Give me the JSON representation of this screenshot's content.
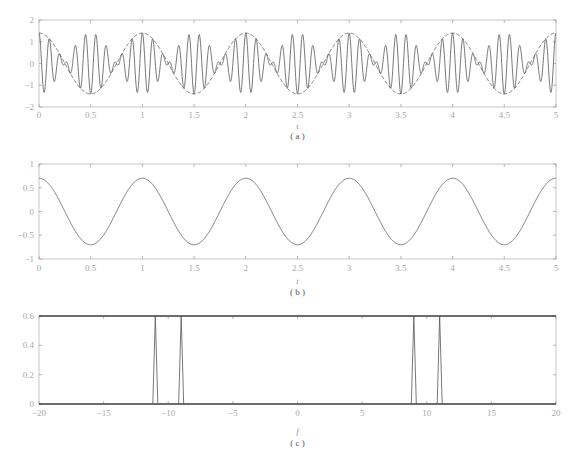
{
  "chart_data": [
    {
      "id": "a",
      "type": "line",
      "caption": "( a )",
      "xlabel": "t",
      "ylabel": "",
      "xlim": [
        0,
        5
      ],
      "ylim": [
        -2,
        2
      ],
      "xticks": [
        "0",
        "0.5",
        "1",
        "1.5",
        "2",
        "2.5",
        "3",
        "3.5",
        "4",
        "4.5",
        "5"
      ],
      "yticks": [
        "2",
        "1",
        "0",
        "-1",
        "-2"
      ],
      "grid": false,
      "series": [
        {
          "name": "signal",
          "style": "solid",
          "description": "0.7cos(2π·9t)+0.7cos(2π·11t)",
          "components": [
            {
              "amp": 0.7,
              "freq": 9
            },
            {
              "amp": 0.7,
              "freq": 11
            }
          ]
        },
        {
          "name": "envelope",
          "style": "dashed",
          "description": "~1.4cos(2πt)",
          "amp": 1.4,
          "freq": 1
        }
      ]
    },
    {
      "id": "b",
      "type": "line",
      "caption": "( b )",
      "xlabel": "t",
      "ylabel": "",
      "xlim": [
        0,
        5
      ],
      "ylim": [
        -1,
        1
      ],
      "xticks": [
        "0",
        "0.5",
        "1",
        "1.5",
        "2",
        "2.5",
        "3",
        "3.5",
        "4",
        "4.5",
        "5"
      ],
      "yticks": [
        "1",
        "0.5",
        "0",
        "-0.5",
        "-1"
      ],
      "grid": false,
      "series": [
        {
          "name": "demodulated",
          "style": "solid",
          "description": "0.7cos(2πt)",
          "amp": 0.7,
          "freq": 1
        }
      ]
    },
    {
      "id": "c",
      "type": "line",
      "caption": "( c )",
      "xlabel": "f",
      "ylabel": "",
      "xlim": [
        -20,
        20
      ],
      "ylim": [
        0,
        0.6
      ],
      "xticks": [
        "-20",
        "-15",
        "-10",
        "-5",
        "0",
        "5",
        "10",
        "15",
        "20"
      ],
      "yticks": [
        "0.6",
        "0.4",
        "0.2",
        "0"
      ],
      "grid": false,
      "series": [
        {
          "name": "spectrum",
          "style": "solid",
          "x": [
            -11,
            -9,
            9,
            11
          ],
          "values": [
            0.6,
            0.6,
            0.6,
            0.6
          ]
        }
      ]
    }
  ]
}
